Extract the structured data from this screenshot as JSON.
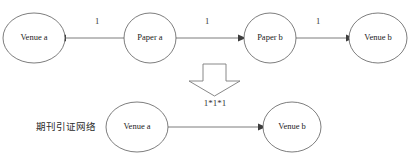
{
  "figure": {
    "caption": "期刊引证网络",
    "transform_label": "1*1*1",
    "transform_icon": "down-block-arrow-icon"
  },
  "top_row": {
    "nodes": [
      {
        "id": "venue-a-top",
        "label": "Venue a",
        "cx": 34,
        "cy": 38,
        "r": 24
      },
      {
        "id": "paper-a",
        "label": "Paper a",
        "cx": 150,
        "cy": 38,
        "r": 24
      },
      {
        "id": "paper-b",
        "label": "Paper b",
        "cx": 270,
        "cy": 38,
        "r": 24
      },
      {
        "id": "venue-b-top",
        "label": "Venue b",
        "cx": 378,
        "cy": 38,
        "r": 24
      }
    ],
    "edges": [
      {
        "id": "edge-paper-a-to-venue-a",
        "from": "paper-a",
        "to": "venue-a-top",
        "weight": "1",
        "label_x": 97,
        "label_y": 22,
        "direction": "left"
      },
      {
        "id": "edge-paper-a-to-paper-b",
        "from": "paper-a",
        "to": "paper-b",
        "weight": "1",
        "label_x": 207,
        "label_y": 22,
        "direction": "right"
      },
      {
        "id": "edge-paper-b-to-venue-b",
        "from": "paper-b",
        "to": "venue-b-top",
        "weight": "1",
        "label_x": 318,
        "label_y": 22,
        "direction": "right"
      }
    ]
  },
  "bottom_row": {
    "nodes": [
      {
        "id": "venue-a-bottom",
        "label": "Venue a",
        "cx": 137,
        "cy": 127,
        "r": 24
      },
      {
        "id": "venue-b-bottom",
        "label": "Venue b",
        "cx": 292,
        "cy": 127,
        "r": 24
      }
    ],
    "edges": [
      {
        "id": "edge-venue-a-to-venue-b",
        "from": "venue-a-bottom",
        "to": "venue-b-bottom",
        "weight": "",
        "direction": "right"
      }
    ]
  },
  "colors": {
    "background": "#ffffff",
    "stroke": "#5c5c5c",
    "arrow_fill": "#3d3d3d",
    "text": "#222222",
    "block_arrow_stroke": "#7a7a7a"
  }
}
